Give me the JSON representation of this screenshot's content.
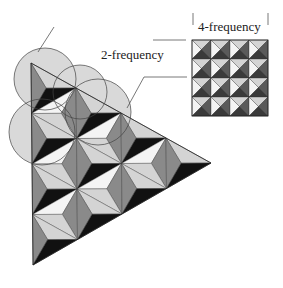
{
  "figure": {
    "labels": {
      "four_frequency": "4-frequency",
      "two_frequency": "2-frequency"
    },
    "colors": {
      "background": "#ffffff",
      "light_face": "#d4d4d4",
      "white_face": "#f4f4f4",
      "mid_face": "#8a8a8a",
      "dark_face": "#5a5a5a",
      "black_face": "#111111",
      "circle_fill": "#d9d9d9",
      "stroke": "#333333"
    },
    "four_frequency_grid": {
      "x": 192,
      "y": 40,
      "size": 76,
      "cells": 4
    },
    "triangle": {
      "apex": [
        31,
        63
      ],
      "right": [
        211,
        163
      ],
      "bottom": [
        33,
        265
      ],
      "frequency": 4
    },
    "circles": [
      {
        "cx": 45,
        "cy": 79,
        "r": 31
      },
      {
        "cx": 80,
        "cy": 92,
        "r": 27
      },
      {
        "cx": 98,
        "cy": 112,
        "r": 33
      },
      {
        "cx": 42,
        "cy": 132,
        "r": 33
      }
    ],
    "leader_lines": [
      {
        "points": [
          [
            38,
            52
          ],
          [
            54,
            27
          ]
        ]
      },
      {
        "points": [
          [
            153,
            40
          ],
          [
            186,
            40
          ]
        ]
      },
      {
        "points": [
          [
            127,
            108
          ],
          [
            144,
            77
          ],
          [
            187,
            77
          ]
        ]
      },
      {
        "points": [
          [
            193,
            13
          ],
          [
            193,
            25
          ]
        ]
      },
      {
        "points": [
          [
            268,
            13
          ],
          [
            268,
            25
          ]
        ]
      }
    ]
  }
}
